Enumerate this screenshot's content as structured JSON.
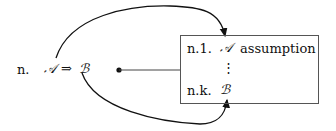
{
  "main_line": {
    "label": "n.",
    "formula_a": "𝒜",
    "arrow": "⇒",
    "formula_b": "ℬ"
  },
  "box": {
    "first_line": {
      "label": "n.1.",
      "formula": "𝒜",
      "justification": "assumption"
    },
    "dots": "⋮",
    "last_line": {
      "label": "n.k.",
      "formula": "ℬ"
    }
  }
}
